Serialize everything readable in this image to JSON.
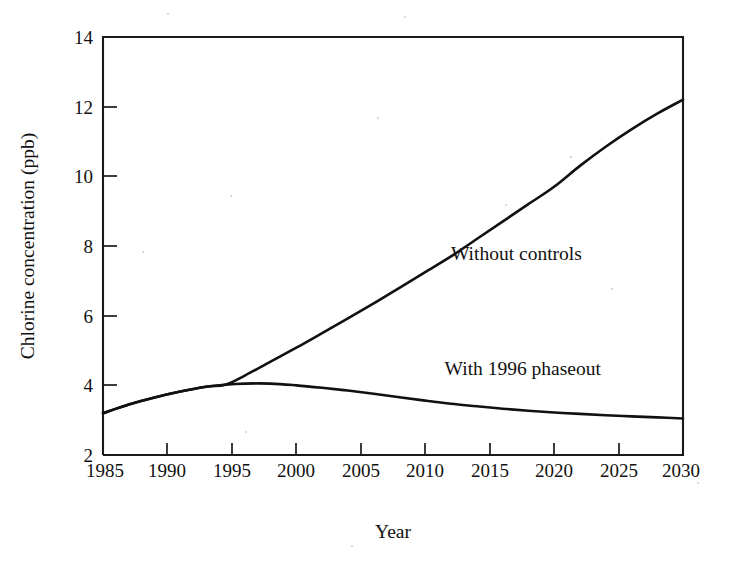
{
  "chart_data": {
    "type": "line",
    "title": "",
    "subtitle": "",
    "xlabel": "Year",
    "ylabel": "Chlorine concentration (ppb)",
    "xlim": [
      1985,
      2030
    ],
    "ylim": [
      2,
      14
    ],
    "xticks": [
      1985,
      1990,
      1995,
      2000,
      2005,
      2010,
      2015,
      2020,
      2025,
      2030
    ],
    "xtick_labels": [
      "1985",
      "1990",
      "1995",
      "2000",
      "2005",
      "2010",
      "2015",
      "2020",
      "2025",
      "2030"
    ],
    "yticks": [
      2,
      4,
      6,
      8,
      10,
      12,
      14
    ],
    "ytick_labels": [
      "2",
      "4",
      "6",
      "8",
      "10",
      "12",
      "14"
    ],
    "grid": false,
    "legend_position": "inline-annotation",
    "line_color": "#111111",
    "series": [
      {
        "name": "Without controls",
        "label_x": 2012,
        "label_y": 7.6,
        "x": [
          1985,
          1987,
          1989,
          1991,
          1993,
          1994.5,
          1996,
          1998,
          2000,
          2002,
          2004,
          2006,
          2008,
          2010,
          2012,
          2014,
          2016,
          2018,
          2020,
          2022,
          2024,
          2026,
          2028,
          2030
        ],
        "values": [
          3.2,
          3.45,
          3.65,
          3.82,
          3.96,
          4.02,
          4.28,
          4.68,
          5.08,
          5.5,
          5.92,
          6.35,
          6.8,
          7.25,
          7.7,
          8.2,
          8.7,
          9.2,
          9.7,
          10.3,
          10.85,
          11.35,
          11.8,
          12.2
        ]
      },
      {
        "name": "With 1996 phaseout",
        "label_x": 2011.5,
        "label_y": 4.3,
        "x": [
          1985,
          1987,
          1989,
          1991,
          1993,
          1994.5,
          1996,
          1998,
          2000,
          2002,
          2004,
          2006,
          2008,
          2010,
          2012,
          2014,
          2016,
          2018,
          2020,
          2022,
          2024,
          2026,
          2028,
          2030
        ],
        "values": [
          3.2,
          3.45,
          3.65,
          3.82,
          3.96,
          4.02,
          4.05,
          4.05,
          4.0,
          3.93,
          3.85,
          3.76,
          3.66,
          3.56,
          3.47,
          3.4,
          3.33,
          3.27,
          3.22,
          3.18,
          3.14,
          3.11,
          3.08,
          3.05
        ]
      }
    ],
    "annotations": [
      {
        "text": "Without controls",
        "x": 2012,
        "y": 7.6
      },
      {
        "text": "With 1996 phaseout",
        "x": 2011.5,
        "y": 4.3
      }
    ]
  },
  "axes": {
    "y_label": "Chlorine concentration (ppb)",
    "x_label": "Year"
  }
}
